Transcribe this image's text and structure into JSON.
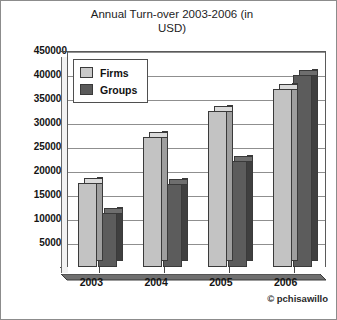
{
  "chart_data": {
    "type": "bar",
    "title": "Annual Turn-over 2003-2006 (in USD)",
    "title_line1": "Annual Turn-over 2003-2006 (in",
    "title_line2": "USD)",
    "xlabel": "",
    "ylabel": "",
    "categories": [
      "2003",
      "2004",
      "2005",
      "2006"
    ],
    "series": [
      {
        "name": "Firms",
        "values": [
          175000,
          270000,
          325000,
          370000
        ],
        "color": "#c3c3c3"
      },
      {
        "name": "Groups",
        "values": [
          113000,
          173000,
          220000,
          400000
        ],
        "color": "#5c5c5c"
      }
    ],
    "ylim": [
      0,
      450000
    ],
    "ytick_step": 50000,
    "yticks": [
      "0",
      "50000",
      "100000",
      "150000",
      "200000",
      "250000",
      "300000",
      "350000",
      "400000",
      "450000"
    ],
    "grid": true,
    "legend_position": "inside-top-left",
    "three_d": true
  },
  "watermark": "© pchisawillo",
  "legend": {
    "items": [
      {
        "label": "Firms"
      },
      {
        "label": "Groups"
      }
    ]
  }
}
